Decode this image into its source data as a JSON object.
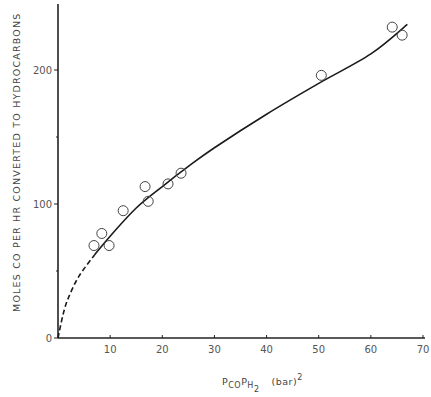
{
  "chart_data": {
    "type": "scatter",
    "title": "",
    "xlabel": "P_CO P_H2 (bar)^2",
    "xlabel_parts": {
      "p1": "P",
      "sub1": "CO",
      "p2": "P",
      "sub2": "H",
      "sub2b": "2",
      "units": "(bar)",
      "sup": "2"
    },
    "ylabel": "MOLES CO PER HR CONVERTED TO HYDROCARBONS",
    "xlim": [
      0,
      70
    ],
    "ylim": [
      0,
      250
    ],
    "x_ticks": [
      0,
      10,
      20,
      30,
      40,
      50,
      60,
      70
    ],
    "x_tick_labels": [
      "10",
      "20",
      "30",
      "40",
      "50",
      "60",
      "70"
    ],
    "y_ticks": [
      0,
      100,
      200
    ],
    "y_tick_labels": [
      "0",
      "100",
      "200"
    ],
    "grid": false,
    "legend": null,
    "series": [
      {
        "name": "measured",
        "marker": "open-circle",
        "x": [
          6.9,
          8.4,
          9.8,
          12.5,
          16.7,
          17.3,
          21.1,
          23.6,
          50.5,
          64.1,
          66.0
        ],
        "y": [
          69,
          78,
          69,
          95,
          113,
          102,
          115,
          123,
          196,
          232,
          226
        ]
      },
      {
        "name": "fitted curve (solid)",
        "style": "solid",
        "x": [
          7,
          10,
          15,
          20,
          25,
          30,
          40,
          50,
          60,
          67
        ],
        "y": [
          62,
          76,
          97,
          113,
          128,
          142,
          167,
          190,
          212,
          234
        ]
      },
      {
        "name": "extrapolation (dashed)",
        "style": "dashed",
        "x": [
          0,
          1,
          2,
          4,
          7
        ],
        "y": [
          0,
          18,
          30,
          46,
          62
        ]
      }
    ]
  }
}
